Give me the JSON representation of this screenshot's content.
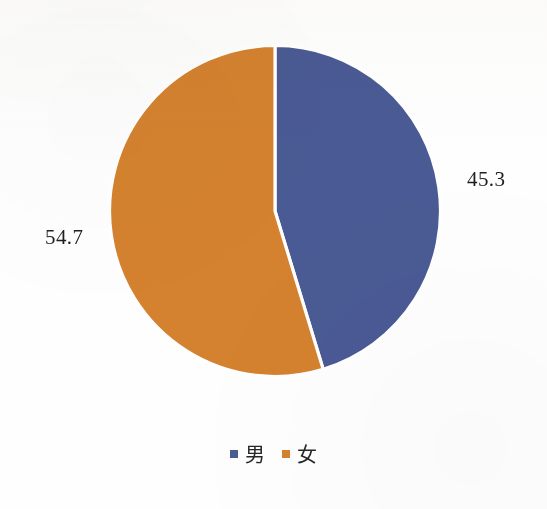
{
  "chart_data": {
    "type": "pie",
    "title": "",
    "subtitle": "",
    "xlabel": "",
    "ylabel": "",
    "grid": false,
    "legend_position": "bottom",
    "start_angle_deg": 0,
    "direction": "clockwise",
    "labels": [
      "男",
      "女"
    ],
    "values": [
      45.3,
      54.7
    ],
    "value_label_texts": [
      "45.3",
      "54.7"
    ],
    "value_label_position": "outside",
    "units": "percent",
    "slices": [
      {
        "name": "男",
        "value": 45.3,
        "value_text": "45.3",
        "color": "#4a5a94"
      },
      {
        "name": "女",
        "value": 54.7,
        "value_text": "54.7",
        "color": "#d4822f"
      }
    ],
    "legend": [
      {
        "label": "男",
        "marker": "square",
        "color": "#4a5a94"
      },
      {
        "label": "女",
        "marker": "square",
        "color": "#d4822f"
      }
    ],
    "colors": {
      "series_1": "#4a5a94",
      "series_2": "#d4822f",
      "background": "#fefefe",
      "slice_border": "#ffffff",
      "text": "#1f1f1f"
    },
    "annotations": []
  }
}
